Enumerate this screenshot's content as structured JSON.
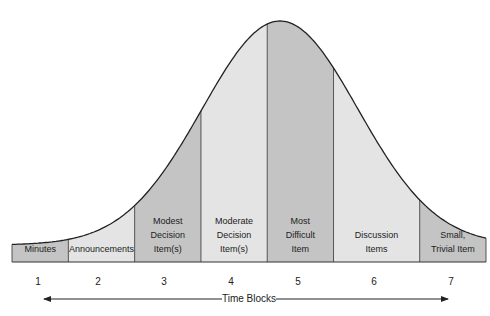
{
  "chart_data": {
    "type": "area",
    "title": "",
    "xlabel": "Time Blocks",
    "ylabel": "",
    "categories": [
      "1",
      "2",
      "3",
      "4",
      "5",
      "6",
      "7"
    ],
    "blocks": [
      {
        "number": "1",
        "label": [
          "Minutes"
        ],
        "shade": "#c4c4c4",
        "relative_width": 0.85
      },
      {
        "number": "2",
        "label": [
          "Announcements"
        ],
        "shade": "#e4e4e4",
        "relative_width": 1.0
      },
      {
        "number": "3",
        "label": [
          "Modest",
          "Decision",
          "Item(s)"
        ],
        "shade": "#c4c4c4",
        "relative_width": 1.0
      },
      {
        "number": "4",
        "label": [
          "Moderate",
          "Decision",
          "Item(s)"
        ],
        "shade": "#e4e4e4",
        "relative_width": 1.0
      },
      {
        "number": "5",
        "label": [
          "Most",
          "Difficult",
          "Item"
        ],
        "shade": "#c4c4c4",
        "relative_width": 1.0
      },
      {
        "number": "6",
        "label": [
          "Discussion",
          "Items"
        ],
        "shade": "#e4e4e4",
        "relative_width": 1.3
      },
      {
        "number": "7",
        "label": [
          "Small,",
          "Trivial Item"
        ],
        "shade": "#c4c4c4",
        "relative_width": 1.0
      }
    ],
    "curve_peak_block": 5,
    "axis_arrow": "both-directions",
    "grid": false,
    "legend": "none"
  }
}
